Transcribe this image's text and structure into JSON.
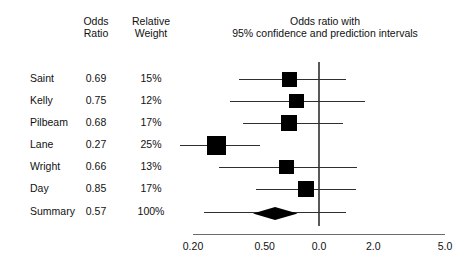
{
  "headers": {
    "odds_ratio": "Odds\nRatio",
    "relative_weight": "Relative\nWeight"
  },
  "chart_title": "Odds ratio with\n95% confidence and prediction intervals",
  "chart_data": {
    "type": "forest",
    "title": "Odds ratio with 95% confidence and prediction intervals",
    "xlabel": "",
    "ylabel": "",
    "xscale": "log",
    "xticks": [
      "0.20",
      "0.50",
      "0.0",
      "2.0",
      "5.0"
    ],
    "xtick_values": [
      0.2,
      0.5,
      1.0,
      2.0,
      5.0
    ],
    "xlim": [
      0.2,
      5.0
    ],
    "reference_line": 1.0,
    "grid": false,
    "legend": "none",
    "columns": [
      "Study",
      "Odds Ratio",
      "Relative Weight"
    ],
    "studies": [
      {
        "name": "Saint",
        "odds_ratio": "0.69",
        "or_value": 0.69,
        "weight": "15%",
        "weight_value": 15,
        "ci_low": 0.36,
        "ci_high": 1.42,
        "marker_scale": 0.6
      },
      {
        "name": "Kelly",
        "odds_ratio": "0.75",
        "or_value": 0.75,
        "weight": "12%",
        "weight_value": 12,
        "ci_low": 0.32,
        "ci_high": 1.79,
        "marker_scale": 0.52
      },
      {
        "name": "Pilbeam",
        "odds_ratio": "0.68",
        "or_value": 0.68,
        "weight": "17%",
        "weight_value": 17,
        "ci_low": 0.38,
        "ci_high": 1.36,
        "marker_scale": 0.66
      },
      {
        "name": "Lane",
        "odds_ratio": "0.27",
        "or_value": 0.27,
        "weight": "25%",
        "weight_value": 25,
        "ci_low": 0.17,
        "ci_high": 0.47,
        "marker_scale": 1.0
      },
      {
        "name": "Wright",
        "odds_ratio": "0.66",
        "or_value": 0.66,
        "weight": "13%",
        "weight_value": 13,
        "ci_low": 0.28,
        "ci_high": 1.62,
        "marker_scale": 0.54
      },
      {
        "name": "Day",
        "odds_ratio": "0.85",
        "or_value": 0.85,
        "weight": "17%",
        "weight_value": 17,
        "ci_low": 0.45,
        "ci_high": 1.6,
        "marker_scale": 0.66
      }
    ],
    "summary": {
      "name": "Summary",
      "odds_ratio": "0.57",
      "or_value": 0.57,
      "weight": "100%",
      "weight_value": 100,
      "ci_low": 0.43,
      "ci_high": 0.76,
      "pi_low": 0.23,
      "pi_high": 1.42
    }
  },
  "colors": {
    "marker": "#000000",
    "ci_line": "#2f2f2f",
    "axis": "#6b6b6b",
    "reference": "#595959",
    "text": "#111111",
    "background": "#ffffff"
  }
}
